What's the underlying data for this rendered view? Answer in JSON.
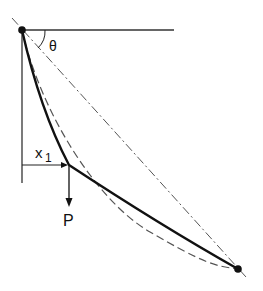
{
  "diagram": {
    "title": "",
    "labels": {
      "angle": "θ",
      "distance": "x",
      "distance_subscript": "1",
      "load": "P"
    },
    "supports": [
      {
        "name": "top-left-support",
        "x": 22,
        "y": 30
      },
      {
        "name": "bottom-right-support",
        "x": 238,
        "y": 269
      }
    ],
    "load_point": {
      "x": 69,
      "y": 165
    },
    "colors": {
      "ink": "#111111",
      "background": "#ffffff"
    }
  }
}
